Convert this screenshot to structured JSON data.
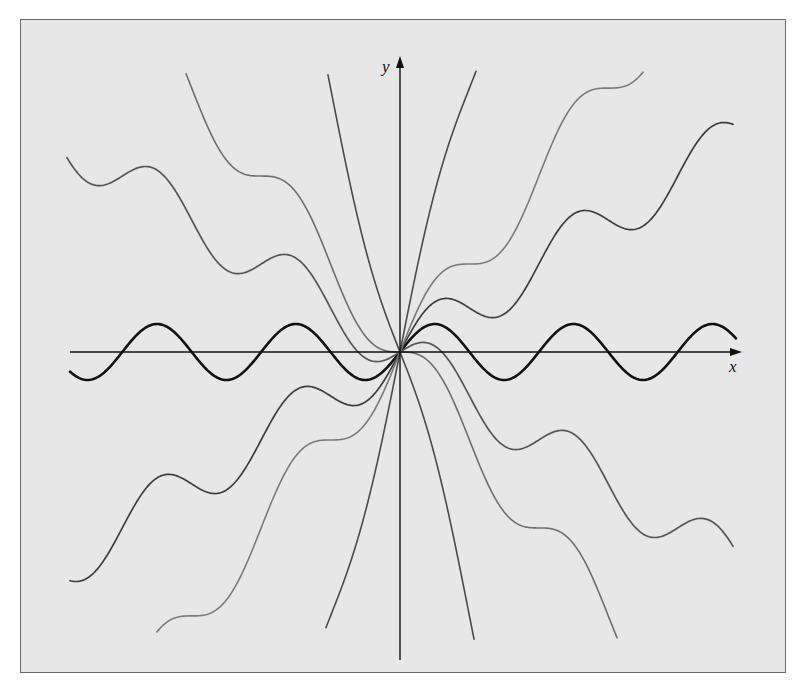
{
  "chart_data": {
    "type": "line",
    "title": "",
    "xlabel": "x",
    "ylabel": "y",
    "grid": false,
    "legend": null,
    "axes": {
      "origin_px": [
        400,
        352
      ],
      "x_scale_px_per_unit": 22.1,
      "y_scale_px_per_unit": 28,
      "x_axis_px": [
        70,
        742
      ],
      "y_axis_px": [
        660,
        56
      ]
    },
    "series": [
      {
        "name": "y = sin x",
        "C": 0,
        "x_range": [
          -14.93,
          15.2
        ],
        "color": "#111111",
        "width": 2.6
      },
      {
        "name": "y = 0.5x + sin x",
        "C": 0.5,
        "x_range": [
          -14.93,
          15.07
        ],
        "color": "#3e3e3e",
        "width": 1.7
      },
      {
        "name": "y = -0.5x + sin x",
        "C": -0.5,
        "x_range": [
          -15.07,
          15.07
        ],
        "color": "#555555",
        "width": 1.7
      },
      {
        "name": "y = x + sin x",
        "C": 1,
        "x_range": [
          -11.0,
          11.0
        ],
        "color": "#7a7a7a",
        "width": 1.6
      },
      {
        "name": "y = -x + sin x",
        "C": -1,
        "x_range": [
          -9.68,
          9.82
        ],
        "color": "#6e6e6e",
        "width": 1.6
      },
      {
        "name": "y = 3x + sin x",
        "C": 3,
        "x_range": [
          -3.35,
          3.44
        ],
        "color": "#4a4a4a",
        "width": 1.6
      },
      {
        "name": "y = -3x + sin x",
        "C": -3,
        "x_range": [
          -3.26,
          3.35
        ],
        "color": "#4a4a4a",
        "width": 1.6
      }
    ]
  },
  "labels": {
    "x_axis": "x",
    "y_axis": "y"
  },
  "colors": {
    "background": "#e7e7e7",
    "frame_border": "#6a6a6a",
    "axis": "#111111"
  }
}
